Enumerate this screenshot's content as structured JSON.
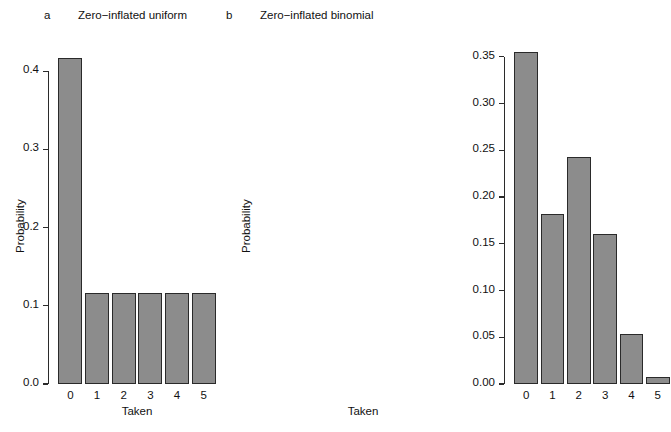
{
  "figure": {
    "background": "#ffffff",
    "bar_fill": "#8c8c8c",
    "bar_border": "#2a2a2a",
    "axis_color": "#2b2b2b"
  },
  "panels": [
    {
      "letter": "a",
      "title": "Zero−inflated uniform",
      "xlabel": "Taken",
      "ylabel": "Probability"
    },
    {
      "letter": "b",
      "title": "Zero−inflated binomial",
      "xlabel": "Taken",
      "ylabel": "Probability"
    }
  ],
  "chart_data": [
    {
      "type": "bar",
      "title": "Zero−inflated uniform",
      "panel_label": "a",
      "xlabel": "Taken",
      "ylabel": "Probability",
      "categories": [
        "0",
        "1",
        "2",
        "3",
        "4",
        "5"
      ],
      "values": [
        0.417,
        0.117,
        0.117,
        0.117,
        0.117,
        0.117
      ],
      "ylim": [
        0.0,
        0.44
      ],
      "ytick_labels": [
        "0.0",
        "0.1",
        "0.2",
        "0.3",
        "0.4"
      ],
      "ytick_values": [
        0.0,
        0.1,
        0.2,
        0.3,
        0.4
      ],
      "xtick_labels": [
        "0",
        "1",
        "2",
        "3",
        "4",
        "5"
      ],
      "grid": false,
      "legend": "none"
    },
    {
      "type": "bar",
      "title": "Zero−inflated binomial",
      "panel_label": "b",
      "xlabel": "Taken",
      "ylabel": "Probability",
      "categories": [
        "0",
        "1",
        "2",
        "3",
        "4",
        "5"
      ],
      "values": [
        0.355,
        0.182,
        0.243,
        0.161,
        0.054,
        0.007
      ],
      "ylim": [
        0.0,
        0.368
      ],
      "ytick_labels": [
        "0.00",
        "0.05",
        "0.10",
        "0.15",
        "0.20",
        "0.25",
        "0.30",
        "0.35"
      ],
      "ytick_values": [
        0.0,
        0.05,
        0.1,
        0.15,
        0.2,
        0.25,
        0.3,
        0.35
      ],
      "xtick_labels": [
        "0",
        "1",
        "2",
        "3",
        "4",
        "5"
      ],
      "grid": false,
      "legend": "none"
    }
  ]
}
